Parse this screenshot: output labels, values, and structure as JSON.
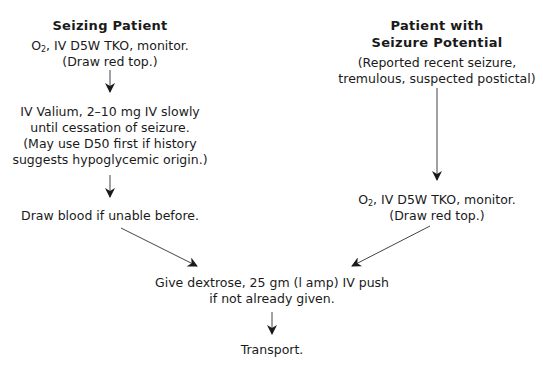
{
  "left_branch": {
    "title": "Seizing Patient",
    "step1": {
      "line1_prefix": "O",
      "line1_sub": "2",
      "line1_rest": ", IV D5W TKO, monitor.",
      "line2": "(Draw red top.)"
    },
    "step2": {
      "line1": "IV Valium, 2–10 mg IV slowly",
      "line2": "until cessation of seizure.",
      "line3": "(May use D50 first if history",
      "line4": "suggests hypoglycemic origin.)"
    },
    "step3": {
      "line1": "Draw blood if unable before."
    }
  },
  "right_branch": {
    "title_line1": "Patient with",
    "title_line2": "Seizure Potential",
    "description": {
      "line1": "(Reported recent seizure,",
      "line2": "tremulous, suspected postictal)"
    },
    "step1": {
      "line1_prefix": "O",
      "line1_sub": "2",
      "line1_rest": ", IV D5W TKO, monitor.",
      "line2": "(Draw red top.)"
    }
  },
  "merge": {
    "step1": {
      "line1": "Give dextrose, 25 gm (l amp) IV push",
      "line2": "if not already given."
    },
    "step2": {
      "line1": "Transport."
    }
  },
  "colors": {
    "text": "#1a1a1a",
    "arrow": "#333333"
  }
}
